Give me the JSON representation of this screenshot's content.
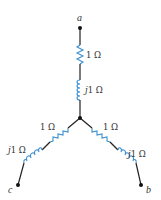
{
  "diagram": {
    "title": "",
    "type": "three-phase wye-connected impedance load",
    "colors": {
      "wire": "#222222",
      "component": "#3a8fd0",
      "node": "#111111",
      "text": "#333333"
    },
    "nodes": [
      {
        "id": "a",
        "label": "a"
      },
      {
        "id": "b",
        "label": "b"
      },
      {
        "id": "c",
        "label": "c"
      },
      {
        "id": "n",
        "label": ""
      }
    ],
    "branches": [
      {
        "terminal": "a",
        "resistor": {
          "label": "1 Ω",
          "prefix": "",
          "value": "1 Ω"
        },
        "inductor": {
          "label": "j1 Ω",
          "prefix": "j",
          "value": "1 Ω"
        }
      },
      {
        "terminal": "c",
        "resistor": {
          "label": "1 Ω",
          "prefix": "",
          "value": "1 Ω"
        },
        "inductor": {
          "label": "j1 Ω",
          "prefix": "j",
          "value": "1 Ω"
        }
      },
      {
        "terminal": "b",
        "resistor": {
          "label": "1 Ω",
          "prefix": "",
          "value": "1 Ω"
        },
        "inductor": {
          "label": "j1 Ω",
          "prefix": "j",
          "value": "1 Ω"
        }
      }
    ]
  }
}
